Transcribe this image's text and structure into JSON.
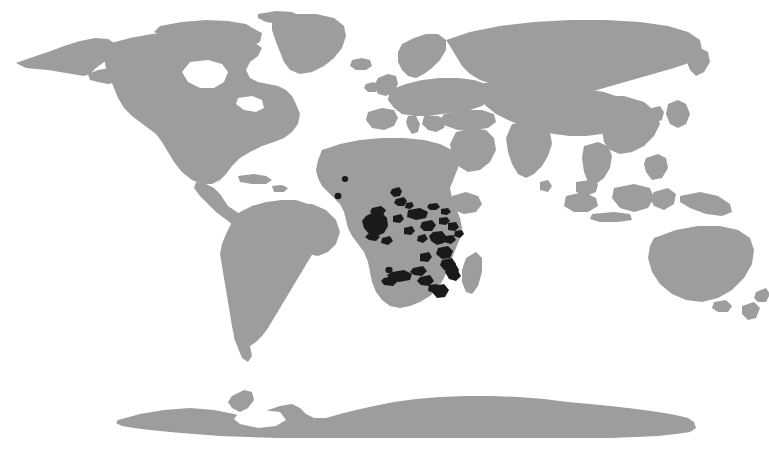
{
  "figure": {
    "name": "world-distribution-map",
    "type": "thematic-distribution-map",
    "projection": "robinson-like",
    "width": 769,
    "height": 453,
    "background_color": "#ffffff",
    "has_title": false,
    "has_legend": false,
    "has_axes": false,
    "has_graticule": false,
    "has_labels": false,
    "visible_text": ""
  },
  "colors": {
    "background": "#ffffff",
    "land": "#9d9d9d",
    "range_highlight": "#1a1a1a",
    "land_edge": "#9d9d9d"
  },
  "legend_semantics": {
    "land_meaning": "world landmasses (not part of distribution)",
    "highlight_meaning": "highlighted distribution range"
  },
  "chart_data": {
    "type": "map",
    "title": "",
    "subtitle": "",
    "xlabel": "",
    "ylabel": "",
    "projection": "robinson-like",
    "legend_position": "none",
    "grid": false,
    "series": [
      {
        "name": "Landmass",
        "color": "#9d9d9d",
        "regions": [
          "North America",
          "Greenland",
          "South America",
          "Europe",
          "Africa",
          "Asia",
          "Australia",
          "New Zealand",
          "Madagascar",
          "Antarctica",
          "Iceland",
          "British Isles",
          "Japan",
          "Indonesia",
          "Philippines",
          "Sri Lanka",
          "New Guinea"
        ]
      },
      {
        "name": "Distribution range",
        "color": "#1a1a1a",
        "concentration": "Sub-Saharan Africa",
        "patch_count": 28,
        "regions": [
          "Mali / Burkina Faso",
          "Nigeria / Cameroon",
          "Central African Republic",
          "South Sudan",
          "Gabon / Congo coast",
          "Democratic Republic of the Congo",
          "Uganda",
          "Kenya",
          "Rwanda / Burundi",
          "Tanzania",
          "Zambia",
          "Malawi",
          "Mozambique",
          "Zimbabwe",
          "Angola",
          "Northern Namibia / Botswana"
        ]
      }
    ]
  },
  "range_patches": [
    {
      "id": "west-africa-mali",
      "region": "Mali",
      "cx": 345,
      "cy": 179,
      "size": "dot"
    },
    {
      "id": "west-africa-burkina",
      "region": "Burkina Faso",
      "cx": 338,
      "cy": 196,
      "size": "dot"
    },
    {
      "id": "nigeria-plateau",
      "region": "Nigeria plateau",
      "cx": 395,
      "cy": 193,
      "size": "small"
    },
    {
      "id": "cameroon-highlands",
      "region": "Cameroon highlands",
      "cx": 400,
      "cy": 199,
      "size": "small"
    },
    {
      "id": "car-north",
      "region": "Central African Republic",
      "cx": 433,
      "cy": 207,
      "size": "small"
    },
    {
      "id": "south-sudan",
      "region": "South Sudan",
      "cx": 443,
      "cy": 212,
      "size": "small"
    },
    {
      "id": "gabon-coast",
      "region": "Gabon coast",
      "cx": 374,
      "cy": 224,
      "size": "large"
    },
    {
      "id": "congo-west",
      "region": "Congo west",
      "cx": 397,
      "cy": 219,
      "size": "small"
    },
    {
      "id": "drc-north",
      "region": "DR Congo north",
      "cx": 417,
      "cy": 215,
      "size": "medium"
    },
    {
      "id": "drc-central",
      "region": "DR Congo central",
      "cx": 409,
      "cy": 231,
      "size": "small"
    },
    {
      "id": "drc-east",
      "region": "DR Congo east",
      "cx": 428,
      "cy": 228,
      "size": "medium"
    },
    {
      "id": "uganda",
      "region": "Uganda",
      "cx": 443,
      "cy": 222,
      "size": "small"
    },
    {
      "id": "kenya-west",
      "region": "Kenya west",
      "cx": 452,
      "cy": 227,
      "size": "small"
    },
    {
      "id": "rwanda-burundi",
      "region": "Rwanda / Burundi",
      "cx": 438,
      "cy": 238,
      "size": "medium"
    },
    {
      "id": "tanzania-north",
      "region": "Tanzania north",
      "cx": 449,
      "cy": 240,
      "size": "small"
    },
    {
      "id": "tanzania-central",
      "region": "Tanzania central",
      "cx": 444,
      "cy": 252,
      "size": "medium"
    },
    {
      "id": "tanzania-south",
      "region": "Tanzania south",
      "cx": 448,
      "cy": 262,
      "size": "medium"
    },
    {
      "id": "zambia-north",
      "region": "Zambia north",
      "cx": 425,
      "cy": 258,
      "size": "small"
    },
    {
      "id": "malawi",
      "region": "Malawi",
      "cx": 451,
      "cy": 270,
      "size": "medium"
    },
    {
      "id": "zambia-south",
      "region": "Zambia south",
      "cx": 419,
      "cy": 272,
      "size": "small"
    },
    {
      "id": "angola-east",
      "region": "Angola east",
      "cx": 400,
      "cy": 276,
      "size": "medium"
    },
    {
      "id": "namibia-caprivi",
      "region": "Caprivi / N. Botswana",
      "cx": 392,
      "cy": 281,
      "size": "medium"
    },
    {
      "id": "zimbabwe-north",
      "region": "Zimbabwe north",
      "cx": 425,
      "cy": 281,
      "size": "small"
    },
    {
      "id": "mozambique-north",
      "region": "Mozambique north",
      "cx": 453,
      "cy": 276,
      "size": "small"
    },
    {
      "id": "mozambique-central",
      "region": "Mozambique central",
      "cx": 440,
      "cy": 292,
      "size": "medium"
    },
    {
      "id": "zimbabwe-east",
      "region": "Zimbabwe east",
      "cx": 432,
      "cy": 288,
      "size": "small"
    },
    {
      "id": "congo-basin-sw",
      "region": "Congo basin SW",
      "cx": 386,
      "cy": 241,
      "size": "small"
    },
    {
      "id": "kenya-east",
      "region": "Kenya east",
      "cx": 458,
      "cy": 234,
      "size": "small"
    }
  ]
}
